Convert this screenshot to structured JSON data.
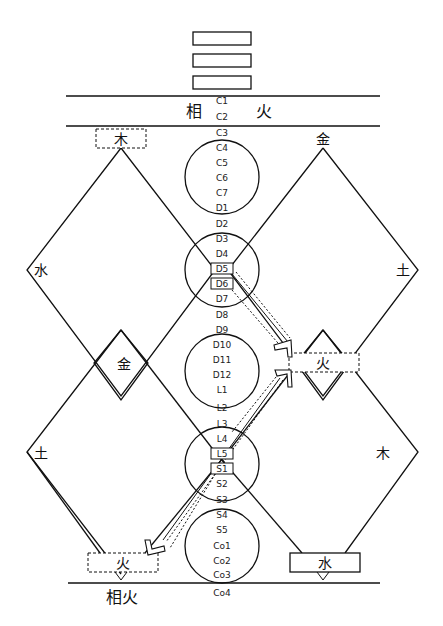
{
  "trigram": {
    "lines": 3,
    "type": "solid-bars"
  },
  "header_band": {
    "left": "相",
    "right": "火"
  },
  "spine_labels": [
    "C1",
    "C2",
    "C3",
    "C4",
    "C5",
    "C6",
    "C7",
    "D1",
    "D2",
    "D3",
    "D4",
    "D5",
    "D6",
    "D7",
    "D8",
    "D9",
    "D10",
    "D11",
    "D12",
    "L1",
    "L2",
    "L3",
    "L4",
    "L5",
    "S1",
    "S2",
    "S3",
    "S4",
    "S5",
    "Co1",
    "Co2",
    "Co3",
    "Co4"
  ],
  "boxed_labels": [
    "D5",
    "D6",
    "L5",
    "S1"
  ],
  "elements": {
    "top_left": "木",
    "top_right": "金",
    "left_upper": "水",
    "right_upper": "土",
    "center_small_diamond": "金",
    "right_small_diamond": "火",
    "left_lower": "土",
    "right_lower": "木",
    "bottom_left_box": "火",
    "bottom_right_box": "水"
  },
  "footer_label": "相火",
  "colors": {
    "line": "#111111",
    "background": "#ffffff"
  }
}
